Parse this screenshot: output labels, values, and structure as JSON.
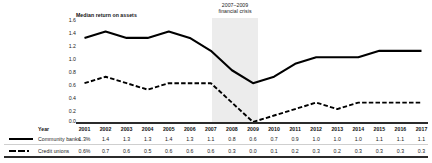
{
  "chart_data": {
    "type": "line",
    "title": "Median return on assets",
    "annotation": {
      "line1": "2007–2009",
      "line2": "financial crisis",
      "span_start": "2007",
      "span_end": "2009"
    },
    "xlabel": "Year",
    "ylabel": "",
    "ylim": [
      0.0,
      1.6
    ],
    "yticks": [
      "1.6",
      "1.4",
      "1.2",
      "1.0",
      "0.8",
      "0.6",
      "0.4",
      "0.2",
      "0.0"
    ],
    "ytick_values": [
      1.6,
      1.4,
      1.2,
      1.0,
      0.8,
      0.6,
      0.4,
      0.2,
      0.0
    ],
    "grid": false,
    "legend_position": "table-left",
    "categories": [
      "2001",
      "2002",
      "2003",
      "2004",
      "2005",
      "2006",
      "2007",
      "2008",
      "2009",
      "2010",
      "2011",
      "2012",
      "2013",
      "2014",
      "2015",
      "2016",
      "2017"
    ],
    "series": [
      {
        "name": "Community banks",
        "style": "solid",
        "color": "#000000",
        "values": [
          1.3,
          1.4,
          1.3,
          1.3,
          1.4,
          1.3,
          1.1,
          0.8,
          0.6,
          0.7,
          0.9,
          1.0,
          1.0,
          1.0,
          1.1,
          1.1,
          1.1
        ],
        "labels": [
          "1.3%",
          "1.4",
          "1.3",
          "1.3",
          "1.4",
          "1.3",
          "1.1",
          "0.8",
          "0.6",
          "0.7",
          "0.9",
          "1.0",
          "1.0",
          "1.0",
          "1.1",
          "1.1",
          "1.1"
        ]
      },
      {
        "name": "Credit unions",
        "style": "dash-dot",
        "color": "#000000",
        "values": [
          0.6,
          0.7,
          0.6,
          0.5,
          0.6,
          0.6,
          0.6,
          0.3,
          0.0,
          0.1,
          0.2,
          0.3,
          0.2,
          0.3,
          0.3,
          0.3,
          0.3
        ],
        "labels": [
          "0.6%",
          "0.7",
          "0.6",
          "0.5",
          "0.6",
          "0.6",
          "0.6",
          "0.3",
          "0.0",
          "0.1",
          "0.2",
          "0.3",
          "0.2",
          "0.3",
          "0.3",
          "0.3",
          "0.3"
        ]
      }
    ]
  }
}
